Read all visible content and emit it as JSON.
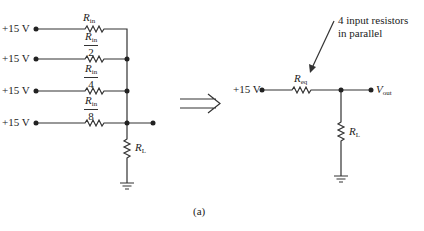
{
  "figure": {
    "caption": "(a)",
    "left_circuit": {
      "sources": [
        {
          "label": "+15 V",
          "resistor": {
            "symbol": "R",
            "subscript": "in",
            "divisor": null
          }
        },
        {
          "label": "+15 V",
          "resistor": {
            "symbol": "R",
            "subscript": "in",
            "divisor": "2"
          }
        },
        {
          "label": "+15 V",
          "resistor": {
            "symbol": "R",
            "subscript": "in",
            "divisor": "4"
          }
        },
        {
          "label": "+15 V",
          "resistor": {
            "symbol": "R",
            "subscript": "in",
            "divisor": "8"
          }
        }
      ],
      "load": {
        "symbol": "R",
        "subscript": "L"
      }
    },
    "transform_arrow": "⟹",
    "right_circuit": {
      "source_label": "+15 V",
      "equivalent_resistor": {
        "symbol": "R",
        "subscript": "eq"
      },
      "output": {
        "symbol": "V",
        "subscript": "out"
      },
      "load": {
        "symbol": "R",
        "subscript": "L"
      },
      "annotation": {
        "line1": "4 input resistors",
        "line2": "in parallel"
      }
    }
  }
}
